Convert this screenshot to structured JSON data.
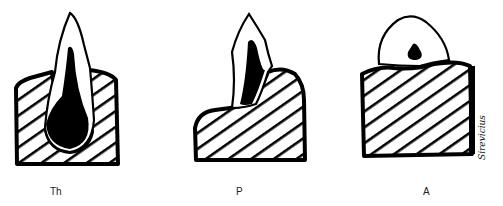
{
  "diagram": {
    "panels": [
      {
        "id": "th",
        "label": "Th"
      },
      {
        "id": "p",
        "label": "P"
      },
      {
        "id": "a",
        "label": "A"
      }
    ],
    "signature": "Sirevicius",
    "colors": {
      "ink": "#000000",
      "background": "#ffffff"
    }
  }
}
